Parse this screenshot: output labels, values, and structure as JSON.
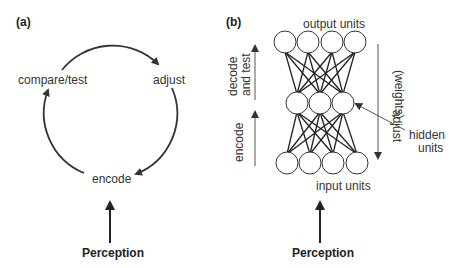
{
  "panel_a": {
    "label": "(a)",
    "cycle": {
      "compare": "compare/test",
      "adjust": "adjust",
      "encode": "encode"
    },
    "input": "Perception"
  },
  "panel_b": {
    "label": "(b)",
    "output_units": "output units",
    "input_units": "input units",
    "hidden_line1": "hidden",
    "hidden_line2": "units",
    "decode_line1": "decode",
    "decode_line2": "and test",
    "encode": "encode",
    "adjust_line1": "adjust",
    "adjust_line2": "(weights)",
    "input": "Perception",
    "layers": {
      "output": 4,
      "hidden": 3,
      "input": 4
    }
  },
  "colors": {
    "ink": "#333333",
    "background": "#ffffff"
  }
}
